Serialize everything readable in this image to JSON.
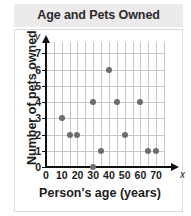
{
  "chart_data": {
    "type": "scatter",
    "title": "Age and Pets Owned",
    "xlabel": "Person's age (years)",
    "ylabel": "Number of pets owned",
    "axis_letter_x": "x",
    "axis_letter_y": "y",
    "xlim": [
      0,
      75
    ],
    "ylim": [
      0,
      7.7
    ],
    "xticks": [
      0,
      10,
      20,
      30,
      40,
      50,
      60,
      70
    ],
    "xtick_labels": [
      "0",
      "10",
      "20",
      "30",
      "40",
      "50",
      "60",
      "70"
    ],
    "yticks": [
      0,
      1,
      2,
      3,
      4,
      5,
      6,
      7
    ],
    "ytick_labels": [
      "0",
      "1",
      "2",
      "3",
      "4",
      "5",
      "6",
      "7"
    ],
    "xgrid_step": 10,
    "ygrid_step": 1,
    "grid": true,
    "legend": false,
    "marker_color": "#6e6c70",
    "points": [
      {
        "x": 10,
        "y": 3
      },
      {
        "x": 15,
        "y": 2
      },
      {
        "x": 20,
        "y": 2
      },
      {
        "x": 30,
        "y": 4
      },
      {
        "x": 30,
        "y": 0
      },
      {
        "x": 35,
        "y": 1
      },
      {
        "x": 40,
        "y": 6
      },
      {
        "x": 45,
        "y": 4
      },
      {
        "x": 50,
        "y": 2
      },
      {
        "x": 60,
        "y": 4
      },
      {
        "x": 65,
        "y": 1
      },
      {
        "x": 70,
        "y": 1
      }
    ]
  },
  "colors": {
    "title_band": "#eceaea",
    "plot_background": "#ffffff",
    "gridline": "#c8c6c6",
    "axis": "#111111",
    "marker": "#6e6c70"
  }
}
